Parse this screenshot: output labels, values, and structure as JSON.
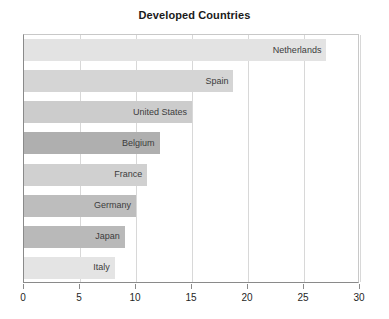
{
  "chart_data": {
    "type": "bar",
    "orientation": "horizontal",
    "title": "Developed Countries",
    "xlabel": "",
    "ylabel": "",
    "xlim": [
      0,
      30
    ],
    "xticks": [
      0,
      5,
      10,
      15,
      20,
      25,
      30
    ],
    "xtick_labels": [
      "0",
      "5",
      "10",
      "15",
      "20",
      "25",
      "30"
    ],
    "grid": true,
    "legend": "none",
    "categories": [
      "Netherlands",
      "Spain",
      "United States",
      "Belgium",
      "France",
      "Germany",
      "Japan",
      "Italy"
    ],
    "values": [
      27,
      18.7,
      15,
      12.1,
      11,
      10,
      9,
      8.1
    ],
    "bars": [
      {
        "label": "Netherlands",
        "value": 27,
        "color": "#e3e3e3"
      },
      {
        "label": "Spain",
        "value": 18.7,
        "color": "#d5d5d5"
      },
      {
        "label": "United States",
        "value": 15,
        "color": "#cccccc"
      },
      {
        "label": "Belgium",
        "value": 12.1,
        "color": "#afafaf"
      },
      {
        "label": "France",
        "value": 11,
        "color": "#d0d0d0"
      },
      {
        "label": "Germany",
        "value": 10,
        "color": "#bdbdbd"
      },
      {
        "label": "Japan",
        "value": 9,
        "color": "#b9b9b9"
      },
      {
        "label": "Italy",
        "value": 8.1,
        "color": "#e4e4e4"
      }
    ]
  }
}
